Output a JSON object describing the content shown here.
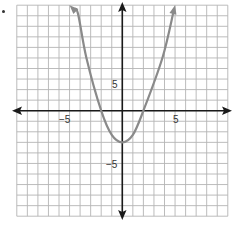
{
  "chart_data": {
    "type": "line",
    "title": "",
    "xlabel": "",
    "ylabel": "",
    "xlim": [
      -10,
      10
    ],
    "ylim": [
      -10,
      10
    ],
    "grid": true,
    "grid_step": 1,
    "x_tick_labels": [
      {
        "value": -5,
        "label": "−5"
      },
      {
        "value": 5,
        "label": "5"
      }
    ],
    "y_tick_labels": [
      {
        "value": 5,
        "label": "5"
      },
      {
        "value": -5,
        "label": "−5"
      }
    ],
    "series": [
      {
        "name": "parabola",
        "description": "Upward-opening parabola with arrows at both ends",
        "vertex": [
          0,
          -3
        ],
        "x_intercepts": [
          -2,
          2
        ],
        "y_intercept": -3,
        "x": [
          -5,
          -4.2,
          -3.4,
          -2,
          -1,
          0,
          1,
          2,
          3.8,
          5
        ],
        "y": [
          10,
          9.2,
          5,
          0,
          -2.3,
          -3,
          -2.3,
          0,
          5,
          10
        ],
        "color": "#8a8a8a"
      }
    ],
    "legend": null
  },
  "colors": {
    "grid": "#b4b4b4",
    "axis": "#1a1a1a",
    "curve": "#8a8a8a"
  },
  "labels": {
    "x_neg5": "−5",
    "x_pos5": "5",
    "y_pos5": "5",
    "y_neg5": "−5"
  }
}
